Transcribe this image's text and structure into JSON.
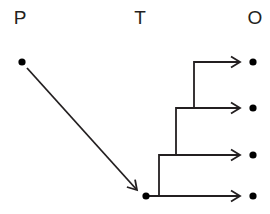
{
  "diagram": {
    "title": "",
    "background_color": "#ffffff",
    "stroke_color": "#231f20",
    "node_color": "#000000",
    "columns": [
      {
        "id": "p",
        "label": "P",
        "x": 22,
        "label_x": 20,
        "label_y": 17
      },
      {
        "id": "t",
        "label": "T",
        "x": 146,
        "label_x": 140,
        "label_y": 17
      },
      {
        "id": "o",
        "label": "O",
        "x": 253,
        "label_x": 255,
        "label_y": 17
      }
    ],
    "nodes": [
      {
        "id": "p1",
        "column": "p",
        "cx": 22,
        "cy": 62,
        "r": 3.6
      },
      {
        "id": "t1",
        "column": "t",
        "cx": 146,
        "cy": 196,
        "r": 3.6
      },
      {
        "id": "o1",
        "column": "o",
        "cx": 253,
        "cy": 62,
        "r": 3.6
      },
      {
        "id": "o2",
        "column": "o",
        "cx": 253,
        "cy": 108,
        "r": 3.6
      },
      {
        "id": "o3",
        "column": "o",
        "cx": 253,
        "cy": 155,
        "r": 3.6
      },
      {
        "id": "o4",
        "column": "o",
        "cx": 253,
        "cy": 196,
        "r": 3.6
      }
    ],
    "edges": [
      {
        "id": "edge-p1-t1",
        "kind": "diagonal-arrow",
        "from": "p1",
        "to": "t1",
        "points": "27,68 137,190",
        "arrow": true
      },
      {
        "id": "edge-t1-o4",
        "kind": "orthogonal-arrow",
        "from": "t1",
        "to": "o4",
        "points": "148,196 240,196",
        "arrow": true
      },
      {
        "id": "edge-t1-o3",
        "kind": "orthogonal-arrow",
        "from": "t1",
        "to": "o3",
        "points": "159,196 159,155 240,155",
        "arrow": true
      },
      {
        "id": "edge-t1-o2",
        "kind": "orthogonal-arrow",
        "from": "t1",
        "to": "o2",
        "points": "176,155 176,108 240,108",
        "arrow": true
      },
      {
        "id": "edge-t1-o1",
        "kind": "orthogonal-arrow",
        "from": "t1",
        "to": "o1",
        "points": "194,108 194,62 240,62",
        "arrow": true
      }
    ],
    "stroke_width": 1.8,
    "arrowhead": {
      "length": 9,
      "half_width": 5.5
    }
  }
}
